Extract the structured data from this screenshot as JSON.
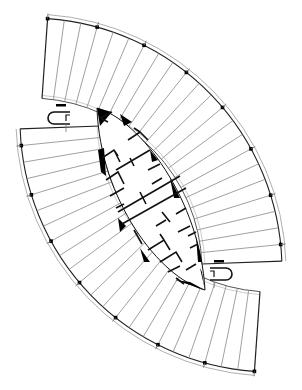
{
  "figure": {
    "type": "architectural-floor-plan",
    "colors": {
      "background": "#ffffff",
      "line": "#1a1a1a",
      "light_line": "#8a8a8a",
      "fill": "#000000"
    }
  },
  "wings": [
    {
      "name": "upper-right-wing",
      "center": [
        30,
        270
      ],
      "outer_r": 252,
      "inner_r": 172,
      "start_deg": -86,
      "end_deg": -2,
      "bays": 22
    },
    {
      "name": "lower-left-wing",
      "center": [
        272,
        120
      ],
      "outer_r": 252,
      "inner_r": 172,
      "start_deg": 94,
      "end_deg": 178,
      "bays": 22
    }
  ],
  "stairs": [
    {
      "name": "stair-upper-left",
      "x": 48,
      "y": 112,
      "flip": false
    },
    {
      "name": "stair-lower-right",
      "x": 232,
      "y": 268,
      "flip": true
    }
  ]
}
